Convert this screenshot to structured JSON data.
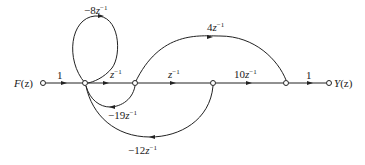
{
  "diagram": {
    "type": "signal-flow-graph",
    "input": {
      "label": "F(z)",
      "name_main": "F",
      "name_arg": "(z)"
    },
    "output": {
      "label": "Y(z)",
      "name_main": "Y",
      "name_arg": "(z)"
    },
    "nodes": [
      {
        "id": "F",
        "x": 43,
        "y": 83
      },
      {
        "id": "n1",
        "x": 85,
        "y": 83
      },
      {
        "id": "n2",
        "x": 135,
        "y": 83
      },
      {
        "id": "n3",
        "x": 213,
        "y": 83
      },
      {
        "id": "n4",
        "x": 286,
        "y": 83
      },
      {
        "id": "Y",
        "x": 329,
        "y": 83
      }
    ],
    "edges": [
      {
        "from": "F",
        "to": "n1",
        "gain": "1",
        "coef": "1",
        "has_z": false
      },
      {
        "from": "n1",
        "to": "n1",
        "gain": "-8z^-1",
        "coef": "−8",
        "has_z": true,
        "kind": "self-loop"
      },
      {
        "from": "n1",
        "to": "n2",
        "gain": "z^-1",
        "coef": "",
        "has_z": true
      },
      {
        "from": "n2",
        "to": "n3",
        "gain": "z^-1",
        "coef": "",
        "has_z": true
      },
      {
        "from": "n3",
        "to": "n4",
        "gain": "10z^-1",
        "coef": "10",
        "has_z": true
      },
      {
        "from": "n4",
        "to": "Y",
        "gain": "1",
        "coef": "1",
        "has_z": false
      },
      {
        "from": "n2",
        "to": "n4",
        "gain": "4z^-1",
        "coef": "4",
        "has_z": true,
        "kind": "feedforward-arc"
      },
      {
        "from": "n2",
        "to": "n1",
        "gain": "-19z^-1",
        "coef": "−19",
        "has_z": true,
        "kind": "feedback-arc"
      },
      {
        "from": "n3",
        "to": "n1",
        "gain": "-12z^-1",
        "coef": "−12",
        "has_z": true,
        "kind": "feedback-arc"
      }
    ],
    "z_symbol": "z",
    "exponent": "−1"
  }
}
